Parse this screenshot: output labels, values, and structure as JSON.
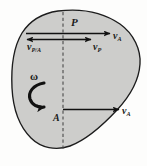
{
  "figure": {
    "type": "kinematics-rigid-body-velocity-diagram",
    "body_fill_color": "#cdcdcb",
    "body_stroke_color": "#1c1c1c",
    "vector_color": "#111111",
    "dashed_axis_color": "#4a4a4a",
    "background_color": "#fdfdfc"
  },
  "points": {
    "P": {
      "label": "P",
      "x": 63,
      "y": 39
    },
    "A": {
      "label": "A",
      "x": 63,
      "y": 110
    }
  },
  "rotation": {
    "symbol": "ω",
    "sense": "counterclockwise",
    "arrow_name": "angular-velocity-arc-arrow"
  },
  "vectors": [
    {
      "name": "v-PA",
      "label_base": "v",
      "label_sub": "P/A",
      "direction": "left",
      "tail_x": 63,
      "tip_x": 26,
      "y": 39,
      "description": "relative velocity of P with respect to A"
    },
    {
      "name": "v-P",
      "label_base": "v",
      "label_sub": "P",
      "direction": "right",
      "tail_x": 63,
      "tip_x": 92,
      "y": 39,
      "description": "absolute velocity of point P"
    },
    {
      "name": "v-A-top",
      "label_base": "v",
      "label_sub": "A",
      "direction": "right",
      "tail_x": 26,
      "tip_x": 111,
      "y": 33,
      "description": "translation velocity of A applied at P"
    },
    {
      "name": "v-A-bottom",
      "label_base": "v",
      "label_sub": "A",
      "direction": "right",
      "tail_x": 63,
      "tip_x": 120,
      "y": 110,
      "description": "velocity of reference point A"
    }
  ],
  "axis": {
    "name": "dashed-vertical-axis",
    "x": 63,
    "y_top": 12,
    "y_bottom": 150,
    "style": "dashed"
  },
  "caption": {
    "smudge_text": ""
  }
}
